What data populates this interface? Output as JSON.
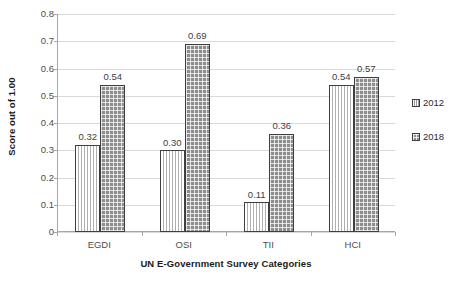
{
  "chart_data": {
    "type": "bar",
    "title": "",
    "subtitle": "",
    "xlabel": "UN E-Government Survey Categories",
    "ylabel": "Score out of 1.00",
    "categories": [
      "EGDI",
      "OSI",
      "TII",
      "HCI"
    ],
    "series": [
      {
        "name": "2012",
        "values": [
          0.32,
          0.3,
          0.11,
          0.54
        ]
      },
      {
        "name": "2018",
        "values": [
          0.54,
          0.69,
          0.36,
          0.57
        ]
      }
    ],
    "value_labels": {
      "2012": [
        "0.32",
        "0.30",
        "0.11",
        "0.54"
      ],
      "2018": [
        "0.54",
        "0.69",
        "0.36",
        "0.57"
      ]
    },
    "ylim": [
      0,
      0.8
    ],
    "ytick_step": 0.1,
    "ytick_labels": [
      "0.8",
      "0.7",
      "0.6",
      "0.5",
      "0.4",
      "0.3",
      "0.2",
      "0.1",
      "0"
    ],
    "ytick_values": [
      0.8,
      0.7,
      0.6,
      0.5,
      0.4,
      0.3,
      0.2,
      0.1,
      0
    ],
    "grid": true,
    "grid_axis": "y",
    "legend_position": "right",
    "legend_entries": [
      "2012",
      "2018"
    ],
    "colors": {
      "series_2012_fill": "#d9d9d9",
      "series_2018_fill": "#8e8e8e",
      "bar_border": "#3f3f3f",
      "gridline": "#d9d9d9",
      "axis": "#a6a6a6",
      "label_text": "#4d4d4d",
      "title_text": "#1a1a1a",
      "background": "#ffffff"
    }
  }
}
